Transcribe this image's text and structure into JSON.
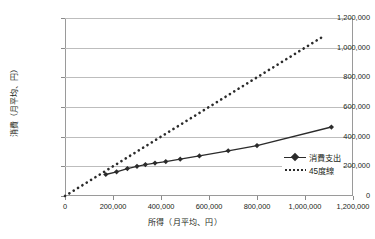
{
  "chart_data": {
    "type": "line",
    "title": "",
    "xlabel": "所得（月平均、円）",
    "ylabel": "消費（月平均、円）",
    "xlim": [
      0,
      1200000
    ],
    "ylim": [
      0,
      1200000
    ],
    "xticks": [
      "0",
      "200,000",
      "400,000",
      "600,000",
      "800,000",
      "1,000,000",
      "1,200,000"
    ],
    "xtick_values": [
      0,
      200000,
      400000,
      600000,
      800000,
      1000000,
      1200000
    ],
    "yticks": [
      "0",
      "200,000",
      "400,000",
      "600,000",
      "800,000",
      "1,000,000",
      "1,200,000"
    ],
    "ytick_values": [
      0,
      200000,
      400000,
      600000,
      800000,
      1000000,
      1200000
    ],
    "grid": true,
    "grid_axis": "y",
    "legend_position": "inside-right",
    "series": [
      {
        "name": "消費支出",
        "style": "solid-line-with-diamond-markers",
        "color": "#2b2b2b",
        "x": [
          170000,
          215000,
          260000,
          300000,
          335000,
          375000,
          420000,
          480000,
          560000,
          680000,
          800000,
          1110000
        ],
        "y": [
          145000,
          163000,
          185000,
          200000,
          212000,
          222000,
          232000,
          248000,
          270000,
          305000,
          340000,
          465000
        ]
      },
      {
        "name": "45度線",
        "style": "dotted-line",
        "color": "#2b2b2b",
        "x": [
          0,
          1080000
        ],
        "y": [
          0,
          1080000
        ]
      }
    ]
  },
  "legend": {
    "items": [
      {
        "label": "消費支出",
        "key": "line-diamond-marker"
      },
      {
        "label": "45度線",
        "key": "dotted-line"
      }
    ]
  }
}
